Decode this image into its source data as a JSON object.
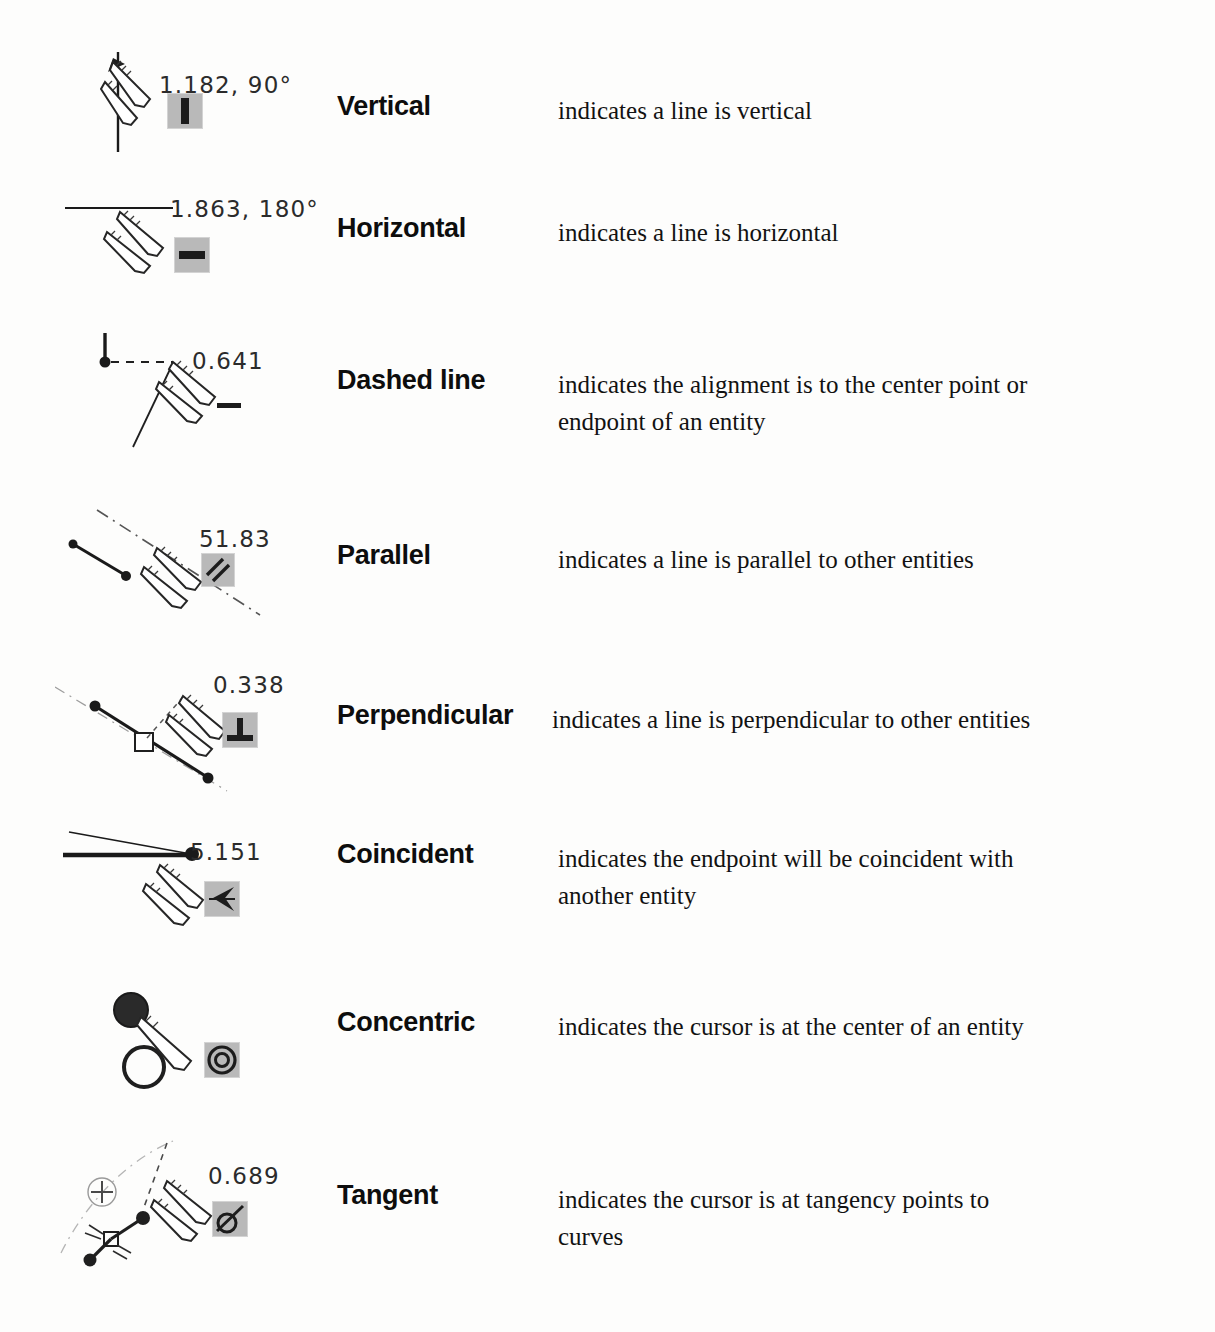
{
  "document": {
    "kind": "reference-table",
    "background_color": "#fdfdfc",
    "text_color": "#101010",
    "badge_color": "#b9b9b9"
  },
  "table": {
    "columns": [
      "figure",
      "term",
      "description"
    ],
    "rows": [
      {
        "id": "vertical",
        "dimension_text": "1.182, 90°",
        "term": "Vertical",
        "description_lines": [
          "indicates a line is vertical"
        ],
        "badge_icon": "vertical-bar-icon"
      },
      {
        "id": "horizontal",
        "dimension_text": "1.863, 180°",
        "term": "Horizontal",
        "description_lines": [
          "indicates a line is horizontal"
        ],
        "badge_icon": "horizontal-bar-icon"
      },
      {
        "id": "dashed-line",
        "dimension_text": "0.641",
        "term": "Dashed line",
        "description_lines": [
          "indicates the alignment is to the center point or",
          "endpoint of an entity"
        ],
        "badge_icon": "dash-icon"
      },
      {
        "id": "parallel",
        "dimension_text": "51.83",
        "term": "Parallel",
        "description_lines": [
          "indicates a line is parallel to other entities"
        ],
        "badge_icon": "parallel-lines-icon"
      },
      {
        "id": "perpendicular",
        "dimension_text": "0.338",
        "term": "Perpendicular",
        "description_lines": [
          "indicates a line is perpendicular to other entities"
        ],
        "badge_icon": "perpendicular-icon"
      },
      {
        "id": "coincident",
        "dimension_text": "5.151",
        "term": "Coincident",
        "description_lines": [
          "indicates the endpoint will be coincident with",
          "another entity"
        ],
        "badge_icon": "coincident-icon"
      },
      {
        "id": "concentric",
        "dimension_text": "",
        "term": "Concentric",
        "description_lines": [
          "indicates the cursor is at the center of an entity"
        ],
        "badge_icon": "concentric-circles-icon"
      },
      {
        "id": "tangent",
        "dimension_text": "0.689",
        "term": "Tangent",
        "description_lines": [
          "indicates the cursor is at tangency points to",
          "curves"
        ],
        "badge_icon": "tangent-icon"
      }
    ]
  }
}
